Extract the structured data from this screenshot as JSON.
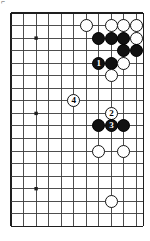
{
  "figure": {
    "corner_label": "⌐",
    "caption": ""
  },
  "board": {
    "type": "go-board-diagram",
    "colors": {
      "background": "#ffffff",
      "grid_line": "#3b3b3b",
      "border_line": "#1e1e1e",
      "black_stone": "#111111",
      "white_stone": "#ffffff",
      "stone_outline": "#141414"
    },
    "geometry": {
      "origin_x": 11,
      "origin_y": 13,
      "spacing": 12.55,
      "columns": 11,
      "rows": 18,
      "stone_diameter": 13
    },
    "star_points": [
      {
        "col": 2,
        "row": 2
      },
      {
        "col": 2,
        "row": 8
      },
      {
        "col": 2,
        "row": 14
      }
    ],
    "stones": [
      {
        "id": "w-a",
        "color": "white",
        "col": 6,
        "row": 1,
        "label": ""
      },
      {
        "id": "w-b",
        "color": "white",
        "col": 8,
        "row": 1,
        "label": ""
      },
      {
        "id": "w-c",
        "color": "white",
        "col": 9,
        "row": 1,
        "label": ""
      },
      {
        "id": "w-d",
        "color": "white",
        "col": 10,
        "row": 1,
        "label": ""
      },
      {
        "id": "b-a",
        "color": "black",
        "col": 7,
        "row": 2,
        "label": ""
      },
      {
        "id": "b-b",
        "color": "black",
        "col": 8,
        "row": 2,
        "label": ""
      },
      {
        "id": "b-c",
        "color": "black",
        "col": 9,
        "row": 2,
        "label": ""
      },
      {
        "id": "w-e",
        "color": "white",
        "col": 10,
        "row": 2,
        "label": ""
      },
      {
        "id": "b-d",
        "color": "black",
        "col": 9,
        "row": 3,
        "label": ""
      },
      {
        "id": "b-e",
        "color": "black",
        "col": 10,
        "row": 3,
        "label": ""
      },
      {
        "id": "b-1",
        "color": "black",
        "col": 7,
        "row": 4,
        "label": "1"
      },
      {
        "id": "b-f",
        "color": "black",
        "col": 8,
        "row": 4,
        "label": ""
      },
      {
        "id": "w-f",
        "color": "white",
        "col": 9,
        "row": 4,
        "label": ""
      },
      {
        "id": "w-g",
        "color": "white",
        "col": 8,
        "row": 5,
        "label": ""
      },
      {
        "id": "w-4",
        "color": "white",
        "col": 5,
        "row": 7,
        "label": "4"
      },
      {
        "id": "w-2",
        "color": "white",
        "col": 8,
        "row": 8,
        "label": "2"
      },
      {
        "id": "b-g",
        "color": "black",
        "col": 7,
        "row": 9,
        "label": ""
      },
      {
        "id": "b-3",
        "color": "black",
        "col": 8,
        "row": 9,
        "label": "3"
      },
      {
        "id": "b-h",
        "color": "black",
        "col": 9,
        "row": 9,
        "label": ""
      },
      {
        "id": "w-h",
        "color": "white",
        "col": 7,
        "row": 11,
        "label": ""
      },
      {
        "id": "w-i",
        "color": "white",
        "col": 9,
        "row": 11,
        "label": ""
      },
      {
        "id": "w-j",
        "color": "white",
        "col": 8,
        "row": 15,
        "label": ""
      }
    ]
  }
}
